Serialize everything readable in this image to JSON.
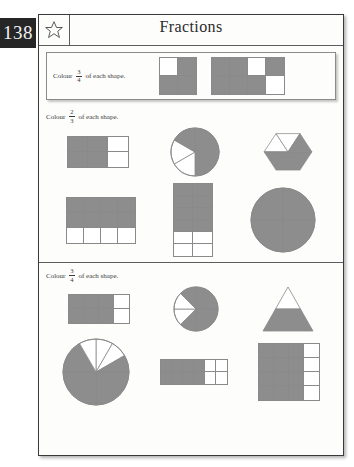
{
  "page": {
    "number": "138",
    "title": "Fractions",
    "star_icon": "star-icon"
  },
  "colors": {
    "shaded": "#8d8d8d",
    "empty": "#ffffff",
    "outline": "#8a8a8a",
    "page_tab_bg": "#262626",
    "page_tab_text": "#f2f2f2",
    "sheet_border": "#3a3a3a",
    "text": "#3b3b3b"
  },
  "sections": [
    {
      "id": "section-1",
      "instruction_prefix": "Colour",
      "fraction": {
        "numerator": "3",
        "denominator": "4"
      },
      "instruction_suffix": "of each shape.",
      "boxed": true,
      "rows": [
        {
          "shapes": [
            {
              "name": "grid-2x2-three-quarters",
              "type": "grid",
              "cols": 2,
              "rows": 2,
              "cell_w": 18,
              "cell_h": 18,
              "shaded_cells": [
                1,
                2,
                3
              ],
              "total_cells": 4
            },
            {
              "name": "grid-4x2-three-quarters",
              "type": "grid",
              "cols": 4,
              "rows": 2,
              "cell_w": 18,
              "cell_h": 18,
              "shaded_cells": [
                0,
                1,
                3,
                4,
                5,
                6
              ],
              "total_cells": 8
            }
          ]
        }
      ]
    },
    {
      "id": "section-2",
      "instruction_prefix": "Colour",
      "fraction": {
        "numerator": "2",
        "denominator": "3"
      },
      "instruction_suffix": "of each shape.",
      "boxed": false,
      "rows": [
        {
          "shapes": [
            {
              "name": "grid-3x2-two-thirds",
              "type": "grid",
              "cols": 3,
              "rows": 2,
              "cell_w": 20,
              "cell_h": 15,
              "shaded_cells": [
                0,
                1,
                3,
                4
              ],
              "total_cells": 6
            },
            {
              "name": "circle-6-sectors-two-thirds",
              "type": "pie",
              "sectors": 6,
              "radius": 24,
              "shaded_sectors": [
                0,
                1,
                2,
                5
              ],
              "start_angle": -90
            },
            {
              "name": "hexagon-6-triangles-two-thirds",
              "type": "hexagon",
              "sectors": 6,
              "radius": 26,
              "shaded_sectors": [
                2,
                3,
                4,
                5
              ]
            }
          ]
        },
        {
          "shapes": [
            {
              "name": "grid-4x3-two-thirds",
              "type": "grid",
              "cols": 4,
              "rows": 3,
              "cell_w": 17,
              "cell_h": 15,
              "shaded_cells": [
                0,
                1,
                2,
                3,
                4,
                5,
                6,
                7
              ],
              "total_cells": 12
            },
            {
              "name": "grid-2x6-two-thirds",
              "type": "grid",
              "cols": 2,
              "rows": 6,
              "cell_w": 19,
              "cell_h": 12,
              "shaded_cells": [
                0,
                1,
                2,
                3,
                4,
                5,
                6,
                7
              ],
              "total_cells": 12
            },
            {
              "name": "circle-12-sectors-full",
              "type": "pie",
              "sectors": 12,
              "radius": 32,
              "shaded_sectors": [
                0,
                1,
                2,
                3,
                4,
                5,
                6,
                7,
                8,
                9,
                10,
                11
              ],
              "start_angle": -90
            }
          ]
        }
      ]
    },
    {
      "id": "section-3",
      "instruction_prefix": "Colour",
      "fraction": {
        "numerator": "3",
        "denominator": "4"
      },
      "instruction_suffix": "of each shape.",
      "boxed": false,
      "rows": [
        {
          "shapes": [
            {
              "name": "grid-4x2-three-quarters-b",
              "type": "grid",
              "cols": 4,
              "rows": 2,
              "cell_w": 15,
              "cell_h": 14,
              "shaded_cells": [
                0,
                1,
                2,
                4,
                5,
                6
              ],
              "total_cells": 8
            },
            {
              "name": "circle-8-sectors-three-quarters",
              "type": "pie",
              "sectors": 8,
              "radius": 22,
              "shaded_sectors": [
                0,
                1,
                2,
                3,
                4,
                7
              ],
              "start_angle": -90
            },
            {
              "name": "triangle-4-parts-three-quarters",
              "type": "triangle4",
              "size": 50,
              "shaded_parts": [
                1,
                2,
                3
              ]
            }
          ]
        },
        {
          "shapes": [
            {
              "name": "circle-12-sectors-three-quarters",
              "type": "pie",
              "sectors": 12,
              "radius": 33,
              "shaded_sectors": [
                2,
                3,
                4,
                5,
                6,
                7,
                8,
                9,
                10
              ],
              "start_angle": -90
            },
            {
              "name": "grid-6x2-three-quarters",
              "type": "grid",
              "cols": 6,
              "rows": 2,
              "cell_w": 11,
              "cell_h": 12,
              "shaded_cells": [
                0,
                1,
                2,
                3,
                6,
                7,
                8,
                9
              ],
              "total_cells": 12
            },
            {
              "name": "grid-4x4-three-quarters",
              "type": "grid",
              "cols": 4,
              "rows": 4,
              "cell_w": 15,
              "cell_h": 14,
              "shaded_cells": [
                0,
                1,
                2,
                4,
                5,
                6,
                8,
                9,
                10,
                12,
                13,
                14
              ],
              "total_cells": 16
            }
          ]
        }
      ]
    }
  ]
}
